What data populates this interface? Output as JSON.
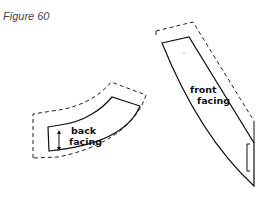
{
  "figure": {
    "title": "Figure 60",
    "pieces": [
      {
        "name": "back-facing",
        "label_lines": [
          "back",
          "facing"
        ]
      },
      {
        "name": "front-facing",
        "label_lines": [
          "front",
          "facing"
        ]
      }
    ]
  }
}
